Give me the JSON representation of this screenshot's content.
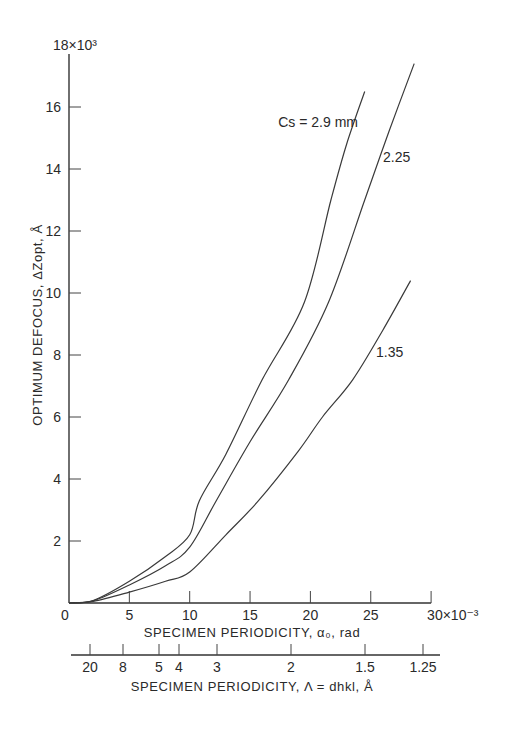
{
  "chart_data": {
    "type": "line",
    "title": "",
    "xlabel": "SPECIMEN PERIODICITY, α₀, rad",
    "x_multiplier_label": "30×10⁻³",
    "xlim": [
      0,
      30
    ],
    "x_ticks": [
      0,
      5,
      10,
      15,
      20,
      25,
      30
    ],
    "x_tick_labels": [
      "0",
      "5",
      "10",
      "15",
      "20",
      "25",
      "30×10⁻³"
    ],
    "ylabel": "OPTIMUM DEFOCUS, ΔZ_opt, Å",
    "ylim": [
      0,
      18000
    ],
    "y_ticks": [
      2000,
      4000,
      6000,
      8000,
      10000,
      12000,
      14000,
      16000,
      18000
    ],
    "y_tick_labels": [
      "2",
      "4",
      "6",
      "8",
      "10",
      "12",
      "14",
      "16",
      "18×10³"
    ],
    "origin_label": "0",
    "secondary_x_axis": {
      "label": "SPECIMEN PERIODICITY, Λ = d_hkl, Å",
      "tick_labels": [
        "20",
        "8",
        "5",
        "4",
        "3",
        "2",
        "1.5",
        "1.25"
      ]
    },
    "grid": false,
    "legend": "inline curve labels",
    "series": [
      {
        "name": "Cs = 2.9 mm",
        "label": "Cs = 2.9 mm",
        "points": [
          [
            0,
            0
          ],
          [
            2,
            80
          ],
          [
            5,
            700
          ],
          [
            8,
            1500
          ],
          [
            10,
            2200
          ],
          [
            10.8,
            3300
          ],
          [
            13,
            4800
          ],
          [
            16,
            7200
          ],
          [
            19.5,
            9700
          ],
          [
            21.7,
            13000
          ],
          [
            23,
            14800
          ],
          [
            24.5,
            16500
          ]
        ]
      },
      {
        "name": "Cs = 2.25 mm",
        "label": "2.25",
        "points": [
          [
            0,
            0
          ],
          [
            2,
            70
          ],
          [
            5,
            580
          ],
          [
            8,
            1200
          ],
          [
            10,
            1800
          ],
          [
            12.2,
            3300
          ],
          [
            15,
            5200
          ],
          [
            18.2,
            7200
          ],
          [
            21.5,
            9700
          ],
          [
            24.5,
            13000
          ],
          [
            26.5,
            15200
          ],
          [
            28.6,
            17400
          ]
        ]
      },
      {
        "name": "Cs = 1.35 mm",
        "label": "1.35",
        "points": [
          [
            0,
            0
          ],
          [
            2,
            50
          ],
          [
            5,
            350
          ],
          [
            8,
            700
          ],
          [
            10,
            1000
          ],
          [
            13,
            2200
          ],
          [
            15.7,
            3300
          ],
          [
            19,
            4900
          ],
          [
            21,
            6000
          ],
          [
            23.5,
            7200
          ],
          [
            26,
            8800
          ],
          [
            28.3,
            10400
          ]
        ]
      }
    ]
  },
  "labels": {
    "y_axis_title": "OPTIMUM DEFOCUS, ΔZopt, Å",
    "x_axis_title": "SPECIMEN PERIODICITY, α₀, rad",
    "x2_axis_title": "SPECIMEN PERIODICITY, Λ = dhkl, Å",
    "curve_a": "Cs = 2.9 mm",
    "curve_b": "2.25",
    "curve_c": "1.35"
  }
}
